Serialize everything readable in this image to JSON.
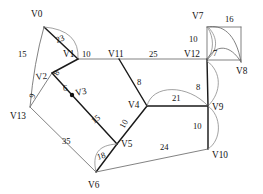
{
  "diagram": {
    "background_color": "#ffffff",
    "edge_color_thick": "#1a1a1a",
    "edge_color_thin": "#6b6b6b",
    "label_color": "#121212"
  },
  "nodes": [
    {
      "id": "V0",
      "label": "V0",
      "x": 44,
      "y": 27,
      "label_x": 31,
      "label_y": 17,
      "dot": false
    },
    {
      "id": "V1",
      "label": "V1",
      "x": 78,
      "y": 59,
      "label_x": 63,
      "label_y": 57,
      "dot": false
    },
    {
      "id": "V2",
      "label": "V2",
      "x": 52,
      "y": 73,
      "label_x": 36,
      "label_y": 80,
      "dot": false
    },
    {
      "id": "V3",
      "label": "V3",
      "x": 72,
      "y": 95,
      "label_x": 76,
      "label_y": 95,
      "dot": true
    },
    {
      "id": "V4",
      "label": "V4",
      "x": 147,
      "y": 106,
      "label_x": 130,
      "label_y": 105,
      "dot": false
    },
    {
      "id": "V5",
      "label": "V5",
      "x": 117,
      "y": 144,
      "label_x": 121,
      "label_y": 146,
      "dot": false
    },
    {
      "id": "V6",
      "label": "V6",
      "x": 96,
      "y": 172,
      "label_x": 88,
      "label_y": 187,
      "dot": false
    },
    {
      "id": "V7",
      "label": "V7",
      "x": 207,
      "y": 27,
      "label_x": 194,
      "label_y": 18,
      "dot": false
    },
    {
      "id": "V8",
      "label": "V8",
      "x": 241,
      "y": 62,
      "label_x": 240,
      "label_y": 73,
      "dot": false
    },
    {
      "id": "V9",
      "label": "V9",
      "x": 208,
      "y": 106,
      "label_x": 212,
      "label_y": 108,
      "dot": false
    },
    {
      "id": "V10",
      "label": "V10",
      "x": 208,
      "y": 149,
      "label_x": 212,
      "label_y": 156,
      "dot": false
    },
    {
      "id": "V11",
      "label": "V11",
      "x": 119,
      "y": 59,
      "label_x": 110,
      "label_y": 57,
      "dot": false
    },
    {
      "id": "V12",
      "label": "V12",
      "x": 207,
      "y": 59,
      "label_x": 188,
      "label_y": 57,
      "dot": false
    },
    {
      "id": "V13",
      "label": "V13",
      "x": 30,
      "y": 107,
      "label_x": 12,
      "label_y": 118,
      "dot": false
    }
  ],
  "edges": [
    {
      "from": "V0",
      "to": "V1",
      "weight": "23",
      "style": "thick",
      "curve": "none",
      "label_x": 57,
      "label_y": 41,
      "label_rotate": -22
    },
    {
      "from": "V0",
      "to": "V1",
      "weight": "",
      "style": "curve",
      "curve": "arc-right",
      "bow": 9
    },
    {
      "from": "V0",
      "to": "V13",
      "weight": "15",
      "style": "thin",
      "curve": "bow",
      "bow": -5,
      "label_x": 22,
      "label_y": 55,
      "label_rotate": 0
    },
    {
      "from": "V1",
      "to": "V11",
      "weight": "10",
      "style": "thin",
      "curve": "none",
      "label_x": 82,
      "label_y": 57,
      "label_rotate": 0
    },
    {
      "from": "V11",
      "to": "V12",
      "weight": "25",
      "style": "thin",
      "curve": "none",
      "label_x": 152,
      "label_y": 57,
      "label_rotate": 0
    },
    {
      "from": "V1",
      "to": "V2",
      "weight": "8",
      "style": "thick",
      "curve": "none",
      "label_x": 58,
      "label_y": 76,
      "label_rotate": -62
    },
    {
      "from": "V2",
      "to": "V13",
      "weight": "9",
      "style": "thin",
      "curve": "none",
      "label_x": 35,
      "label_y": 99,
      "label_rotate": -62
    },
    {
      "from": "V2",
      "to": "V3",
      "weight": "6",
      "style": "thick",
      "curve": "none",
      "label_x": 65,
      "label_y": 92,
      "label_rotate": 0
    },
    {
      "from": "V3",
      "to": "V5",
      "weight": "15",
      "style": "thick",
      "curve": "none",
      "label_x": 96,
      "label_y": 122,
      "label_rotate": -28
    },
    {
      "from": "V11",
      "to": "V4",
      "weight": "8",
      "style": "thick",
      "curve": "none",
      "label_x": 138,
      "label_y": 84,
      "label_rotate": 0
    },
    {
      "from": "V4",
      "to": "V5",
      "weight": "10",
      "style": "thick",
      "curve": "none",
      "label_x": 126,
      "label_y": 127,
      "label_rotate": -62
    },
    {
      "from": "V4",
      "to": "V9",
      "weight": "21",
      "style": "thick",
      "curve": "none",
      "label_x": 174,
      "label_y": 100,
      "label_rotate": 0
    },
    {
      "from": "V4",
      "to": "V9",
      "weight": "",
      "style": "curve",
      "curve": "arc-up",
      "bow": 16
    },
    {
      "from": "V5",
      "to": "V6",
      "weight": "18",
      "style": "thick",
      "curve": "none",
      "label_x": 100,
      "label_y": 158,
      "label_rotate": 0
    },
    {
      "from": "V5",
      "to": "V6",
      "weight": "",
      "style": "curve",
      "curve": "arc-left",
      "bow": 12
    },
    {
      "from": "V13",
      "to": "V6",
      "weight": "35",
      "style": "thin",
      "curve": "none",
      "label_x": 63,
      "label_y": 143,
      "label_rotate": 0
    },
    {
      "from": "V6",
      "to": "V10",
      "weight": "24",
      "style": "thin",
      "curve": "none",
      "label_x": 160,
      "label_y": 148,
      "label_rotate": 0
    },
    {
      "from": "V12",
      "to": "V9",
      "weight": "8",
      "style": "thick",
      "curve": "none",
      "label_x": 197,
      "label_y": 88,
      "label_rotate": 0
    },
    {
      "from": "V12",
      "to": "V9",
      "weight": "",
      "style": "curve",
      "curve": "arc-right",
      "bow": 11
    },
    {
      "from": "V9",
      "to": "V10",
      "weight": "10",
      "style": "thick",
      "curve": "none",
      "label_x": 194,
      "label_y": 127,
      "label_rotate": 0
    },
    {
      "from": "V9",
      "to": "V10",
      "weight": "",
      "style": "curve",
      "curve": "arc-right",
      "bow": 11
    },
    {
      "from": "V7",
      "to": "V12",
      "weight": "10",
      "style": "thin",
      "curve": "none",
      "label_x": 191,
      "label_y": 42,
      "label_rotate": 0
    },
    {
      "from": "V7",
      "to": "V8",
      "weight": "16",
      "style": "thin",
      "curve": "arc-up",
      "bow": 7,
      "label_x": 228,
      "label_y": 22,
      "label_rotate": 0
    },
    {
      "from": "V12",
      "to": "V8",
      "weight": "7",
      "style": "thin",
      "curve": "arc-up",
      "bow": 8,
      "label_x": 214,
      "label_y": 55,
      "label_rotate": 0
    }
  ],
  "vertex_count": 14,
  "edge_count": 17
}
